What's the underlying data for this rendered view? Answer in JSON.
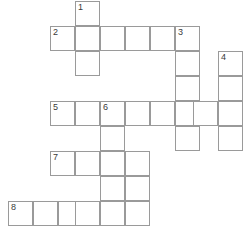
{
  "puzzle": {
    "title": "Crossword Grid",
    "grid": {
      "cell_size": 25,
      "border_color": "#9a9a9a",
      "cell_background": "#ffffff",
      "page_background": "#ffffff",
      "width": 252,
      "height": 230
    },
    "entries": [
      {
        "number": "1",
        "direction": "down",
        "length": 3,
        "start_x": 75,
        "start_y": 1
      },
      {
        "number": "2",
        "direction": "across",
        "length": 6,
        "start_x": 50,
        "start_y": 26
      },
      {
        "number": "3",
        "direction": "down",
        "length": 5,
        "start_x": 175,
        "start_y": 26
      },
      {
        "number": "4",
        "direction": "down",
        "length": 4,
        "start_x": 218,
        "start_y": 51
      },
      {
        "number": "5",
        "direction": "across",
        "length": 8,
        "start_x": 50,
        "start_y": 101
      },
      {
        "number": "6",
        "direction": "down",
        "length": 5,
        "start_x": 100,
        "start_y": 101
      },
      {
        "number": "7",
        "direction": "across",
        "length": 4,
        "start_x": 50,
        "start_y": 151
      },
      {
        "number": "8",
        "direction": "across",
        "length": 6,
        "start_x": 8,
        "start_y": 201
      }
    ],
    "cells": [
      {
        "x": 75,
        "y": 1,
        "number": "1",
        "letter": ""
      },
      {
        "x": 75,
        "y": 26,
        "number": "",
        "letter": ""
      },
      {
        "x": 75,
        "y": 51,
        "number": "",
        "letter": ""
      },
      {
        "x": 50,
        "y": 26,
        "number": "2",
        "letter": ""
      },
      {
        "x": 100,
        "y": 26,
        "number": "",
        "letter": ""
      },
      {
        "x": 125,
        "y": 26,
        "number": "",
        "letter": ""
      },
      {
        "x": 150,
        "y": 26,
        "number": "",
        "letter": ""
      },
      {
        "x": 175,
        "y": 26,
        "number": "3",
        "letter": ""
      },
      {
        "x": 175,
        "y": 51,
        "number": "",
        "letter": ""
      },
      {
        "x": 175,
        "y": 76,
        "number": "",
        "letter": ""
      },
      {
        "x": 175,
        "y": 101,
        "number": "",
        "letter": ""
      },
      {
        "x": 175,
        "y": 126,
        "number": "",
        "letter": ""
      },
      {
        "x": 218,
        "y": 51,
        "number": "4",
        "letter": ""
      },
      {
        "x": 218,
        "y": 76,
        "number": "",
        "letter": ""
      },
      {
        "x": 218,
        "y": 101,
        "number": "",
        "letter": ""
      },
      {
        "x": 218,
        "y": 126,
        "number": "",
        "letter": ""
      },
      {
        "x": 50,
        "y": 101,
        "number": "5",
        "letter": ""
      },
      {
        "x": 75,
        "y": 101,
        "number": "",
        "letter": ""
      },
      {
        "x": 100,
        "y": 101,
        "number": "6",
        "letter": ""
      },
      {
        "x": 125,
        "y": 101,
        "number": "",
        "letter": ""
      },
      {
        "x": 150,
        "y": 101,
        "number": "",
        "letter": ""
      },
      {
        "x": 193,
        "y": 101,
        "number": "",
        "letter": ""
      },
      {
        "x": 100,
        "y": 126,
        "number": "",
        "letter": ""
      },
      {
        "x": 100,
        "y": 151,
        "number": "",
        "letter": ""
      },
      {
        "x": 100,
        "y": 176,
        "number": "",
        "letter": ""
      },
      {
        "x": 100,
        "y": 201,
        "number": "",
        "letter": ""
      },
      {
        "x": 50,
        "y": 151,
        "number": "7",
        "letter": ""
      },
      {
        "x": 75,
        "y": 151,
        "number": "",
        "letter": ""
      },
      {
        "x": 125,
        "y": 151,
        "number": "",
        "letter": ""
      },
      {
        "x": 125,
        "y": 176,
        "number": "",
        "letter": ""
      },
      {
        "x": 8,
        "y": 201,
        "number": "8",
        "letter": ""
      },
      {
        "x": 33,
        "y": 201,
        "number": "",
        "letter": ""
      },
      {
        "x": 58,
        "y": 201,
        "number": "",
        "letter": ""
      },
      {
        "x": 75,
        "y": 201,
        "number": "",
        "letter": ""
      },
      {
        "x": 125,
        "y": 201,
        "number": "",
        "letter": ""
      }
    ]
  }
}
